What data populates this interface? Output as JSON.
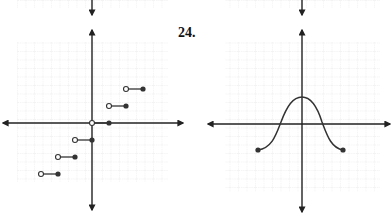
{
  "problem_label": "24.",
  "colors": {
    "grid": "#d4d4d4",
    "axis": "#222222",
    "curve": "#333333",
    "point": "#333333"
  },
  "graphs": [
    {
      "id": "left-graph",
      "type": "step-function",
      "description": "Greatest-integer style step function; each segment has an open circle on the left end and a closed circle on the right end",
      "unit_px": 17,
      "origin_px": [
        92,
        123
      ],
      "segments": [
        {
          "y": 2,
          "x_open": 2,
          "x_closed": 3
        },
        {
          "y": 1,
          "x_open": 1,
          "x_closed": 2
        },
        {
          "y": 0,
          "x_open": 0,
          "x_closed": 1
        },
        {
          "y": -1,
          "x_open": -1,
          "x_closed": 0
        },
        {
          "y": -2,
          "x_open": -2,
          "x_closed": -1
        },
        {
          "y": -3,
          "x_open": -3,
          "x_closed": -2
        }
      ]
    },
    {
      "id": "right-graph",
      "type": "curve",
      "description": "Bell-shaped curve symmetric about the y-axis with closed endpoints",
      "unit_px": 17,
      "origin_px": [
        302,
        124
      ],
      "peak": {
        "x": 0,
        "y": 1.6
      },
      "endpoints": [
        {
          "x": -2.6,
          "y": -1.5,
          "closed": true
        },
        {
          "x": 2.4,
          "y": -1.5,
          "closed": true
        }
      ]
    }
  ],
  "chart_data": [
    {
      "type": "line",
      "title": "Step function graph",
      "series": [
        {
          "name": "y=2",
          "x": [
            2,
            3
          ],
          "y": [
            2,
            2
          ]
        },
        {
          "name": "y=1",
          "x": [
            1,
            2
          ],
          "y": [
            1,
            1
          ]
        },
        {
          "name": "y=0",
          "x": [
            0,
            1
          ],
          "y": [
            0,
            0
          ]
        },
        {
          "name": "y=-1",
          "x": [
            -1,
            0
          ],
          "y": [
            -1,
            -1
          ]
        },
        {
          "name": "y=-2",
          "x": [
            -2,
            -1
          ],
          "y": [
            -2,
            -2
          ]
        },
        {
          "name": "y=-3",
          "x": [
            -3,
            -2
          ],
          "y": [
            -3,
            -3
          ]
        }
      ],
      "xlim": [
        -4.5,
        4.5
      ],
      "ylim": [
        -4,
        5
      ],
      "grid": true
    },
    {
      "type": "line",
      "title": "24.",
      "series": [
        {
          "name": "bell curve",
          "x": [
            -2.6,
            -1.5,
            -1,
            -0.5,
            0,
            0.5,
            1,
            1.5,
            2.4
          ],
          "y": [
            -1.5,
            -1.0,
            0.1,
            1.2,
            1.6,
            1.2,
            0.1,
            -1.0,
            -1.5
          ]
        }
      ],
      "xlim": [
        -4.5,
        4.5
      ],
      "ylim": [
        -4.5,
        5
      ],
      "grid": true
    }
  ]
}
